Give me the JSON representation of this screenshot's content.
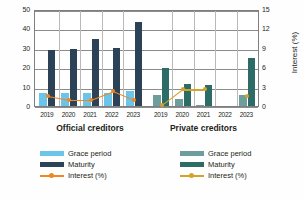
{
  "chart_data": {
    "type": "bar",
    "title": "",
    "panels": [
      {
        "name": "official",
        "title": "Official creditors",
        "categories": [
          "2019",
          "2020",
          "2021",
          "2022",
          "2023"
        ],
        "series": [
          {
            "name": "Grace period",
            "type": "bar",
            "axis": "left",
            "color": "#6cc4e8",
            "values": [
              6.5,
              6.5,
              6.8,
              6.5,
              7.5
            ]
          },
          {
            "name": "Maturity",
            "type": "bar",
            "axis": "left",
            "color": "#2b4257",
            "values": [
              29.0,
              29.5,
              34.5,
              29.8,
              43.5
            ]
          },
          {
            "name": "Interest (%)",
            "type": "line",
            "axis": "right",
            "color": "#ef8722",
            "values": [
              1.9,
              1.3,
              1.3,
              2.6,
              1.2
            ]
          }
        ],
        "legend": [
          {
            "label": "Grace period",
            "color": "#6cc4e8",
            "kind": "bar"
          },
          {
            "label": "Maturity",
            "color": "#2b4257",
            "kind": "bar"
          },
          {
            "label": "Interest (%)",
            "color": "#ef8722",
            "kind": "line"
          }
        ]
      },
      {
        "name": "private",
        "title": "Private creditors",
        "categories": [
          "2019",
          "2020",
          "2021",
          "2022",
          "2023"
        ],
        "series": [
          {
            "name": "Grace period",
            "type": "bar",
            "axis": "left",
            "color": "#6d9e9b",
            "values": [
              5.5,
              3.5,
              0.6,
              0.0,
              5.5
            ]
          },
          {
            "name": "Maturity",
            "type": "bar",
            "axis": "left",
            "color": "#2d6b66",
            "values": [
              19.5,
              11.5,
              11.0,
              0.0,
              24.5
            ]
          },
          {
            "name": "Interest (%)",
            "type": "line",
            "axis": "right",
            "color": "#d4a32a",
            "values": [
              0.4,
              2.9,
              2.9,
              null,
              1.9
            ]
          }
        ],
        "legend": [
          {
            "label": "Grace period",
            "color": "#6d9e9b",
            "kind": "bar"
          },
          {
            "label": "Maturity",
            "color": "#2d6b66",
            "kind": "bar"
          },
          {
            "label": "Interest (%)",
            "color": "#d4a32a",
            "kind": "line"
          }
        ]
      }
    ],
    "axes": {
      "left": {
        "label": "Years",
        "ticks": [
          "0",
          "10",
          "20",
          "30",
          "40",
          "50"
        ],
        "min": 0,
        "max": 50
      },
      "right": {
        "label": "Interest (%)",
        "ticks": [
          "0",
          "3",
          "6",
          "9",
          "12",
          "15"
        ],
        "min": 0,
        "max": 15
      }
    },
    "grid": true,
    "legend_position": "bottom"
  }
}
